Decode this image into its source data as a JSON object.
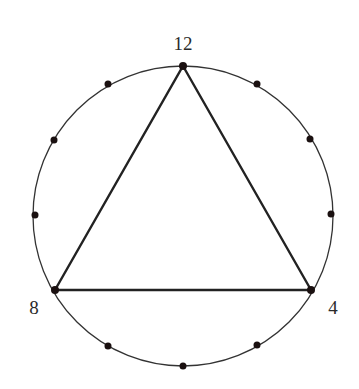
{
  "diagram": {
    "type": "clock-circle-triangle",
    "circle": {
      "cx": 183,
      "cy": 216,
      "r": 150,
      "stroke": "#333333"
    },
    "points": [
      {
        "hour": 12,
        "x": 183,
        "y": 66
      },
      {
        "hour": 1,
        "x": 257,
        "y": 84
      },
      {
        "hour": 2,
        "x": 310,
        "y": 139
      },
      {
        "hour": 3,
        "x": 331,
        "y": 214
      },
      {
        "hour": 4,
        "x": 311,
        "y": 290
      },
      {
        "hour": 5,
        "x": 257,
        "y": 345
      },
      {
        "hour": 6,
        "x": 183,
        "y": 366
      },
      {
        "hour": 7,
        "x": 108,
        "y": 346
      },
      {
        "hour": 8,
        "x": 55,
        "y": 290
      },
      {
        "hour": 9,
        "x": 35,
        "y": 215
      },
      {
        "hour": 10,
        "x": 54,
        "y": 140
      },
      {
        "hour": 11,
        "x": 108,
        "y": 84
      }
    ],
    "triangle": {
      "vertices": [
        12,
        4,
        8
      ],
      "stroke": "#222222"
    },
    "labels": {
      "top": "12",
      "right": "4",
      "left": "8"
    },
    "dot_color": "#1a1010"
  }
}
